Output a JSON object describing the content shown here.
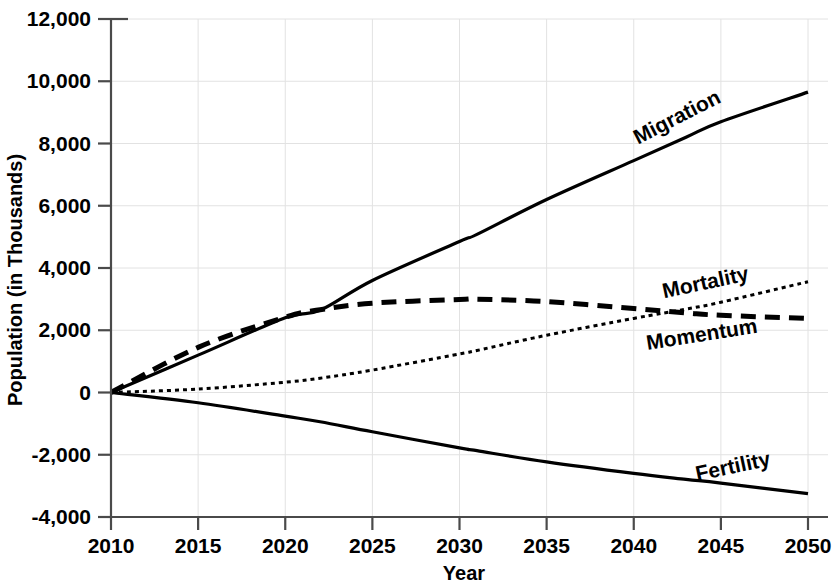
{
  "chart_data": {
    "type": "line",
    "title": "",
    "xlabel": "Year",
    "ylabel": "Population (in Thousands)",
    "xlim": [
      2008,
      2050
    ],
    "ylim": [
      -4000,
      12000
    ],
    "grid": true,
    "legend_position": "inline-labels",
    "x_ticks": [
      "2010",
      "2015",
      "2020",
      "2025",
      "2030",
      "2035",
      "2040",
      "2045",
      "2050"
    ],
    "y_ticks": [
      "12,000",
      "10,000",
      "8,000",
      "6,000",
      "4,000",
      "2,000",
      "0",
      "-2,000",
      "-4,000"
    ],
    "x": [
      2010,
      2015,
      2020,
      2022,
      2025,
      2030,
      2031,
      2035,
      2040,
      2043,
      2045,
      2050
    ],
    "series": [
      {
        "name": "Migration",
        "style": "solid",
        "color": "#000000",
        "values": [
          0,
          1200,
          2400,
          2640,
          3600,
          4850,
          5080,
          6200,
          7450,
          8200,
          8700,
          9650
        ]
      },
      {
        "name": "Momentum",
        "style": "dashed",
        "color": "#000000",
        "values": [
          0,
          1450,
          2420,
          2660,
          2870,
          2990,
          3000,
          2920,
          2700,
          2560,
          2480,
          2380
        ]
      },
      {
        "name": "Mortality",
        "style": "dotted",
        "color": "#6b6b6b",
        "values": [
          0,
          110,
          330,
          460,
          720,
          1240,
          1350,
          1840,
          2380,
          2680,
          2900,
          3560
        ]
      },
      {
        "name": "Fertility",
        "style": "solid",
        "color": "#000000",
        "values": [
          0,
          -330,
          -760,
          -940,
          -1260,
          -1780,
          -1870,
          -2230,
          -2600,
          -2790,
          -2910,
          -3250
        ]
      }
    ],
    "annotations": [
      {
        "text": "Migration",
        "at_year": 2043,
        "rotation": -27
      },
      {
        "text": "Mortality",
        "at_year": 2045,
        "rotation": -12
      },
      {
        "text": "Momentum",
        "at_year": 2045,
        "rotation": -9
      },
      {
        "text": "Fertility",
        "at_year": 2046,
        "rotation": -12
      }
    ]
  }
}
